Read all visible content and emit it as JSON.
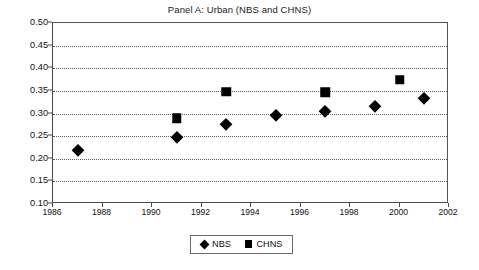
{
  "chart_data": {
    "type": "scatter",
    "title": "Panel A: Urban (NBS and CHNS)",
    "xlabel": "",
    "ylabel": "",
    "xlim": [
      1986,
      2002
    ],
    "ylim": [
      0.1,
      0.5
    ],
    "x_ticks": [
      1986,
      1988,
      1990,
      1992,
      1994,
      1996,
      1998,
      2000,
      2002
    ],
    "y_ticks": [
      0.1,
      0.15,
      0.2,
      0.25,
      0.3,
      0.35,
      0.4,
      0.45,
      0.5
    ],
    "x_tick_labels": [
      "1986",
      "1988",
      "1990",
      "1992",
      "1994",
      "1996",
      "1998",
      "2000",
      "2002"
    ],
    "y_tick_labels": [
      "0.10",
      "0.15",
      "0.20",
      "0.25",
      "0.30",
      "0.35",
      "0.40",
      "0.45",
      "0.50"
    ],
    "grid": "horizontal-dotted",
    "legend_position": "bottom-center",
    "series": [
      {
        "name": "NBS",
        "marker": "diamond",
        "color": "#000000",
        "points": [
          {
            "x": 1987,
            "y": 0.22
          },
          {
            "x": 1991,
            "y": 0.247
          },
          {
            "x": 1993,
            "y": 0.277
          },
          {
            "x": 1995,
            "y": 0.297
          },
          {
            "x": 1997,
            "y": 0.306
          },
          {
            "x": 1999,
            "y": 0.316
          },
          {
            "x": 2001,
            "y": 0.334
          }
        ]
      },
      {
        "name": "CHNS",
        "marker": "square",
        "color": "#000000",
        "points": [
          {
            "x": 1991,
            "y": 0.289
          },
          {
            "x": 1993,
            "y": 0.348
          },
          {
            "x": 1997,
            "y": 0.347
          },
          {
            "x": 2000,
            "y": 0.375
          }
        ]
      }
    ]
  },
  "legend": {
    "entries": [
      {
        "label": "NBS",
        "marker": "diamond"
      },
      {
        "label": "CHNS",
        "marker": "square"
      }
    ]
  }
}
